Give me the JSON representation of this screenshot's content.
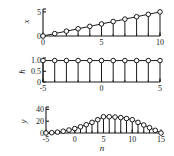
{
  "figure": {
    "xlabel": "n",
    "background": "#ffffff",
    "line_color": "#1a1a1a",
    "marker_face": "#ffffff",
    "marker_edge": "#1a1a1a"
  },
  "chart_data": [
    {
      "type": "line",
      "id": "panel-x",
      "title": "",
      "xlabel": "",
      "ylabel": "x",
      "grid": false,
      "legend": null,
      "xlim": [
        0,
        10
      ],
      "ylim": [
        0,
        5.6
      ],
      "xticks": [
        0,
        5,
        10
      ],
      "xticklabels": [
        "0",
        "5",
        "10"
      ],
      "yticks": [
        0,
        5
      ],
      "yticklabels": [
        "0",
        "5"
      ],
      "minor_xticks": [
        0,
        1,
        2,
        3,
        4,
        5,
        6,
        7,
        8,
        9,
        10
      ],
      "x": [
        0,
        1,
        2,
        3,
        4,
        5,
        6,
        7,
        8,
        9,
        10
      ],
      "values": [
        0,
        0.5,
        1,
        1.5,
        2,
        2.5,
        3,
        3.5,
        4,
        4.5,
        5
      ],
      "style": "stem-with-connecting-line"
    },
    {
      "type": "line",
      "id": "panel-h",
      "title": "",
      "xlabel": "",
      "ylabel": "h",
      "grid": false,
      "legend": null,
      "xlim": [
        -5,
        5
      ],
      "ylim": [
        0,
        1.12
      ],
      "xticks": [
        -5,
        0,
        5
      ],
      "xticklabels": [
        "-5",
        "0",
        "5"
      ],
      "yticks": [
        0,
        0.5,
        1.0
      ],
      "yticklabels": [
        "0",
        "0.5",
        "1.0"
      ],
      "minor_xticks": [
        -5,
        -4,
        -3,
        -2,
        -1,
        0,
        1,
        2,
        3,
        4,
        5
      ],
      "x": [
        -5,
        -4,
        -3,
        -2,
        -1,
        0,
        1,
        2,
        3,
        4,
        5
      ],
      "values": [
        1,
        1,
        1,
        1,
        1,
        1,
        1,
        1,
        1,
        1,
        1
      ],
      "style": "stem-with-connecting-line"
    },
    {
      "type": "line",
      "id": "panel-y",
      "title": "",
      "xlabel": "n",
      "ylabel": "y",
      "grid": false,
      "legend": null,
      "xlim": [
        -5,
        15
      ],
      "ylim": [
        0,
        44
      ],
      "xticks": [
        -5,
        0,
        5,
        10,
        15
      ],
      "xticklabels": [
        "-5",
        "0",
        "5",
        "10",
        "15"
      ],
      "yticks": [
        0,
        20,
        40
      ],
      "yticklabels": [
        "0",
        "20",
        "40"
      ],
      "minor_xticks": [
        -5,
        -4,
        -3,
        -2,
        -1,
        0,
        1,
        2,
        3,
        4,
        5,
        6,
        7,
        8,
        9,
        10,
        11,
        12,
        13,
        14,
        15
      ],
      "x": [
        -5,
        -4,
        -3,
        -2,
        -1,
        0,
        1,
        2,
        3,
        4,
        5,
        6,
        7,
        8,
        9,
        10,
        11,
        12,
        13,
        14,
        15
      ],
      "values": [
        0,
        0.5,
        1.5,
        3,
        5,
        7.5,
        10.5,
        14,
        18,
        22.5,
        27.5,
        27.5,
        27,
        26,
        24.5,
        22.5,
        18,
        13.5,
        9,
        4.5,
        0
      ],
      "style": "stem-with-connecting-line"
    }
  ]
}
